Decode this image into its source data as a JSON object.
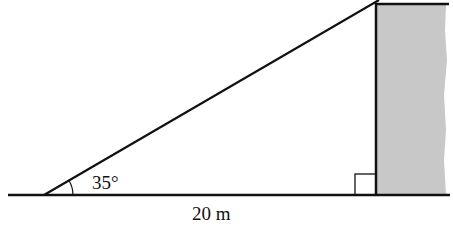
{
  "diagram": {
    "type": "right-triangle-with-wall",
    "angle_label": "35°",
    "base_label": "20 m",
    "right_angle_marker": true,
    "colors": {
      "line": "#111111",
      "wall_fill": "#c8c8c8",
      "background": "#ffffff"
    }
  }
}
